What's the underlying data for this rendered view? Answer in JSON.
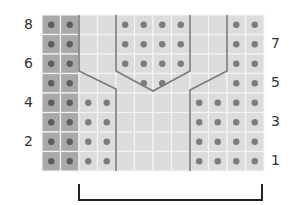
{
  "diagram": {
    "type": "knitting-chart",
    "rows": 8,
    "cols": 12,
    "grid": {
      "x0": 42,
      "y0": 15,
      "cell_w": 18.5,
      "cell_h": 19.5
    },
    "colors": {
      "background": "#ffffff",
      "cell_light": "#dcdcdc",
      "cell_dark": "#a9a9a9",
      "grid_line": "#f4f4f4",
      "dot": "#7c7c7c",
      "dot_dark": "#5e5e5e",
      "cable_line": "#7a7a7a",
      "bracket": "#222222"
    },
    "row_labels_left": [
      {
        "text": "8",
        "row": 0
      },
      {
        "text": "6",
        "row": 2
      },
      {
        "text": "4",
        "row": 4
      },
      {
        "text": "2",
        "row": 6
      }
    ],
    "row_labels_right": [
      {
        "text": "7",
        "row": 1
      },
      {
        "text": "5",
        "row": 3
      },
      {
        "text": "3",
        "row": 5
      },
      {
        "text": "1",
        "row": 7
      }
    ],
    "dark_columns": [
      0,
      1
    ],
    "dots": [
      [
        0,
        1,
        4,
        5,
        6,
        7,
        10,
        11
      ],
      [
        0,
        1,
        4,
        5,
        6,
        7,
        10,
        11
      ],
      [
        0,
        1,
        4,
        5,
        6,
        7,
        10,
        11
      ],
      [
        0,
        1,
        5,
        6,
        10,
        11
      ],
      [
        0,
        1,
        2,
        3,
        8,
        9,
        10,
        11
      ],
      [
        0,
        1,
        2,
        3,
        8,
        9,
        10,
        11
      ],
      [
        0,
        1,
        2,
        3,
        8,
        9,
        10,
        11
      ],
      [
        0,
        1,
        2,
        3,
        8,
        9,
        10,
        11
      ]
    ],
    "cable_lines": [
      [
        [
          79,
          15
        ],
        [
          79,
          71
        ],
        [
          116,
          89
        ],
        [
          116,
          171
        ]
      ],
      [
        [
          116,
          15
        ],
        [
          116,
          71
        ],
        [
          153,
          91
        ],
        [
          190,
          71
        ],
        [
          190,
          15
        ]
      ],
      [
        [
          227,
          15
        ],
        [
          227,
          71
        ],
        [
          190,
          90
        ],
        [
          190,
          171
        ]
      ]
    ],
    "bracket": {
      "x1": 79,
      "x2": 262,
      "y_top": 184,
      "y_bottom": 200
    }
  }
}
